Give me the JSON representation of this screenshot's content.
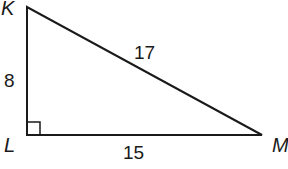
{
  "diagram": {
    "type": "right-triangle",
    "vertices": {
      "K": {
        "label": "K",
        "x": 27,
        "y": 7
      },
      "L": {
        "label": "L",
        "x": 27,
        "y": 135
      },
      "M": {
        "label": "M",
        "x": 262,
        "y": 135
      }
    },
    "sides": {
      "KL": {
        "label": "8"
      },
      "KM": {
        "label": "17"
      },
      "LM": {
        "label": "15"
      }
    },
    "right_angle_at": "L",
    "stroke_color": "#1a1a1a"
  }
}
